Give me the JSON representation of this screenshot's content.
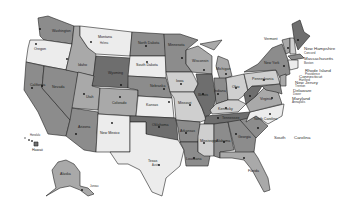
{
  "map": {
    "title": "United States",
    "shades": {
      "s1": "#ececec",
      "s2": "#cfcfcf",
      "s3": "#a9a9a9",
      "s4": "#8c8c8c",
      "s5": "#6e6e6e",
      "bg": "#ffffff"
    },
    "states": {
      "washington": {
        "name": "Washington",
        "capital": "Olympia"
      },
      "oregon": {
        "name": "Oregon",
        "capital": "Salem"
      },
      "california": {
        "name": "California",
        "capital": "Sacramento"
      },
      "nevada": {
        "name": "Nevada",
        "capital": "Carson City"
      },
      "idaho": {
        "name": "Idaho",
        "capital": "Boise"
      },
      "montana": {
        "name": "Montana",
        "capital": "Helena"
      },
      "wyoming": {
        "name": "Wyoming",
        "capital": "Cheyenne"
      },
      "utah": {
        "name": "Utah",
        "capital": "Salt Lake City"
      },
      "colorado": {
        "name": "Colorado",
        "capital": "Denver"
      },
      "arizona": {
        "name": "Arizona",
        "capital": "Phoenix"
      },
      "new_mexico": {
        "name": "New Mexico",
        "capital": "Santa Fe"
      },
      "north_dakota": {
        "name": "North Dakota",
        "capital": "Bismarck"
      },
      "south_dakota": {
        "name": "South Dakota",
        "capital": "Pierre"
      },
      "nebraska": {
        "name": "Nebraska",
        "capital": "Lincoln"
      },
      "kansas": {
        "name": "Kansas",
        "capital": "Topeka"
      },
      "oklahoma": {
        "name": "Oklahoma",
        "capital": "Oklahoma City"
      },
      "texas": {
        "name": "Texas",
        "capital": "Austin"
      },
      "minnesota": {
        "name": "Minnesota",
        "capital": "St. Paul"
      },
      "iowa": {
        "name": "Iowa",
        "capital": "Des Moines"
      },
      "missouri": {
        "name": "Missouri",
        "capital": "Jefferson City"
      },
      "arkansas": {
        "name": "Arkansas",
        "capital": "Little Rock"
      },
      "louisiana": {
        "name": "Louisiana",
        "capital": "Baton Rouge"
      },
      "wisconsin": {
        "name": "Wisconsin",
        "capital": "Madison"
      },
      "illinois": {
        "name": "Illinois",
        "capital": "Springfield"
      },
      "michigan": {
        "name": "Michigan",
        "capital": "Lansing"
      },
      "indiana": {
        "name": "Indiana",
        "capital": "Indianapolis"
      },
      "ohio": {
        "name": "Ohio",
        "capital": "Columbus"
      },
      "kentucky": {
        "name": "Kentucky",
        "capital": "Frankfort"
      },
      "tennessee": {
        "name": "Tennessee",
        "capital": "Nashville"
      },
      "mississippi": {
        "name": "Mississippi",
        "capital": "Jackson"
      },
      "alabama": {
        "name": "Alabama",
        "capital": "Montgomery"
      },
      "georgia": {
        "name": "Georgia",
        "capital": "Atlanta"
      },
      "florida": {
        "name": "Florida",
        "capital": "Tallahassee"
      },
      "south_carolina": {
        "name": "South Carolina",
        "capital": "Columbia"
      },
      "north_carolina": {
        "name": "North Carolina",
        "capital": "Raleigh"
      },
      "virginia": {
        "name": "Virginia",
        "capital": "Richmond"
      },
      "west_virginia": {
        "name": "West Virginia",
        "capital": "Charleston"
      },
      "pennsylvania": {
        "name": "Pennsylvania",
        "capital": "Harrisburg"
      },
      "new_york": {
        "name": "New York",
        "capital": "Albany"
      },
      "vermont": {
        "name": "Vermont",
        "capital": "Montpelier"
      },
      "maine": {
        "name": "Maine",
        "capital": "Augusta"
      },
      "alaska": {
        "name": "Alaska",
        "capital": "Juneau"
      },
      "hawaii": {
        "name": "Hawaii",
        "capital": "Honolulu"
      }
    },
    "external_labels": [
      {
        "name": "New Hampshire",
        "capital": "Concord"
      },
      {
        "name": "Massachusetts",
        "capital": "Boston"
      },
      {
        "name": "Rhode Island",
        "capital": "Providence"
      },
      {
        "name": "Connecticut",
        "capital": "Hartford"
      },
      {
        "name": "New Jersey",
        "capital": "Trenton"
      },
      {
        "name": "Delaware",
        "capital": "Dover"
      },
      {
        "name": "Maryland",
        "capital": "Annapolis"
      }
    ],
    "sc_split_label": {
      "part1": "South",
      "part2": "Carolina"
    }
  }
}
